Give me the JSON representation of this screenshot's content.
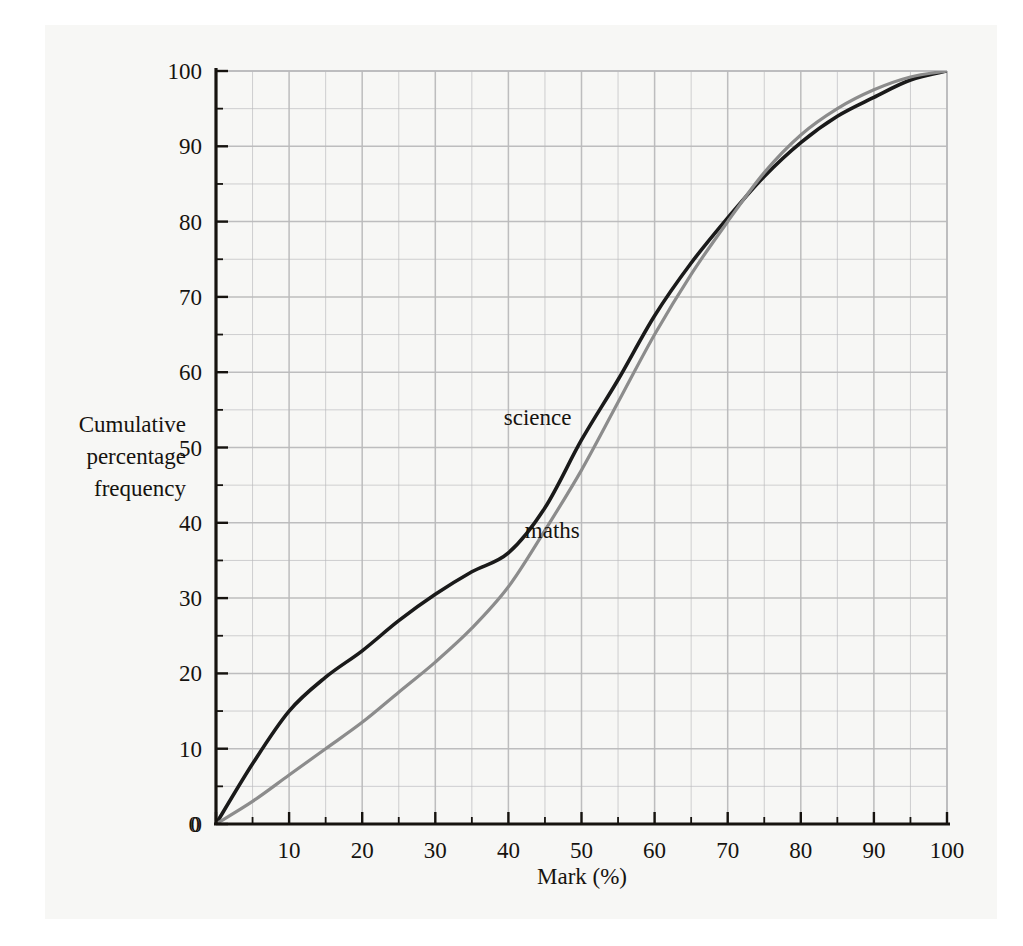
{
  "chart_data": {
    "type": "line",
    "title": "",
    "xlabel": "Mark (%)",
    "ylabel": "Cumulative percentage frequency",
    "xlim": [
      0,
      100
    ],
    "ylim": [
      0,
      100
    ],
    "xticks": [
      0,
      10,
      20,
      30,
      40,
      50,
      60,
      70,
      80,
      90,
      100
    ],
    "yticks": [
      0,
      10,
      20,
      30,
      40,
      50,
      60,
      70,
      80,
      90,
      100
    ],
    "xtick_labels": [
      "0",
      "10",
      "20",
      "30",
      "40",
      "50",
      "60",
      "70",
      "80",
      "90",
      "100"
    ],
    "ytick_labels": [
      "0",
      "10",
      "20",
      "30",
      "40",
      "50",
      "60",
      "70",
      "80",
      "90",
      "100"
    ],
    "minor_tick_step": 5,
    "grid": true,
    "grid_step": 5,
    "grid_color": "#b9b9bb",
    "legend": "inline-curve-labels",
    "x": [
      0,
      5,
      10,
      15,
      20,
      25,
      30,
      35,
      40,
      45,
      50,
      55,
      60,
      65,
      70,
      75,
      80,
      85,
      90,
      95,
      100
    ],
    "series": [
      {
        "name": "science",
        "color": "#1a1a1a",
        "label_x": 44,
        "label_y": 53,
        "values": [
          0,
          8,
          15,
          19.5,
          23,
          27,
          30.5,
          33.5,
          36,
          42,
          51,
          59,
          67.5,
          74.5,
          80.5,
          86,
          90.5,
          94,
          96.5,
          98.8,
          100
        ]
      },
      {
        "name": "maths",
        "color": "#8c8c8c",
        "label_x": 46,
        "label_y": 38,
        "values": [
          0,
          3,
          6.5,
          10,
          13.5,
          17.5,
          21.5,
          26,
          31.5,
          39,
          47,
          56,
          65,
          73,
          80,
          86.5,
          91.5,
          95,
          97.5,
          99.2,
          100
        ]
      }
    ],
    "annotations": [
      {
        "text": "science",
        "x": 44,
        "y": 53
      },
      {
        "text": "maths",
        "x": 46,
        "y": 38
      }
    ]
  },
  "axes": {
    "y_label_lines": [
      "Cumulative",
      "percentage",
      "frequency"
    ],
    "x_label": "Mark (%)"
  },
  "colors": {
    "page_background": "#f7f7f5",
    "outer_background": "#ffffff",
    "axis": "#16130f",
    "grid": "#b9b9bb",
    "science": "#1a1a1a",
    "maths": "#8c8c8c",
    "text": "#16130f"
  }
}
